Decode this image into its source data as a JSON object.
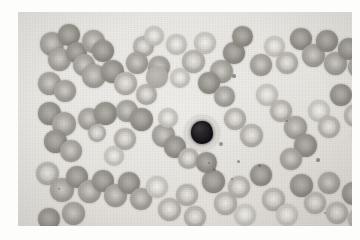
{
  "image": {
    "kind": "photomicrograph",
    "subject": "peripheral blood smear",
    "stain": "Wright-Giemsa",
    "border_color": "#ffffff",
    "field_color": "#e8e6e2",
    "plate": {
      "left": 18,
      "top": 12,
      "width": 334,
      "height": 214
    }
  },
  "palette": {
    "background": "#e8e6e2",
    "rbc_mid": "#a5a19b",
    "rbc_dark": "#8a867f",
    "rbc_pale": "#cbc8c2",
    "central_pallor": "#efedE8",
    "wbc_nucleus": "#171519",
    "wbc_cytoplasm": "#b9b6b1"
  },
  "cells": {
    "white_blood_cell": {
      "label": "lymphocyte",
      "x": 167,
      "y": 104,
      "size": 34,
      "nucleus_label": "dark round nucleus",
      "chromatin": [
        {
          "x": 34,
          "y": 26,
          "r": 4
        },
        {
          "x": 52,
          "y": 44,
          "r": 3
        },
        {
          "x": 28,
          "y": 52,
          "r": 3
        },
        {
          "x": 46,
          "y": 62,
          "r": 2
        }
      ]
    },
    "red_blood_cells": [
      {
        "x": 22,
        "y": 20,
        "d": 24,
        "t": "t1"
      },
      {
        "x": 40,
        "y": 12,
        "d": 22,
        "t": "t3"
      },
      {
        "x": 30,
        "y": 36,
        "d": 23,
        "t": "t1"
      },
      {
        "x": 48,
        "y": 30,
        "d": 21,
        "t": "t3"
      },
      {
        "x": 55,
        "y": 42,
        "d": 22,
        "t": "t1"
      },
      {
        "x": 64,
        "y": 18,
        "d": 23,
        "t": "t1"
      },
      {
        "x": 74,
        "y": 28,
        "d": 22,
        "t": "t3"
      },
      {
        "x": 64,
        "y": 52,
        "d": 24,
        "t": "t1"
      },
      {
        "x": 83,
        "y": 48,
        "d": 23,
        "t": "t3"
      },
      {
        "x": 20,
        "y": 60,
        "d": 23,
        "t": "t1"
      },
      {
        "x": 36,
        "y": 68,
        "d": 22,
        "t": "t1"
      },
      {
        "x": 96,
        "y": 60,
        "d": 23,
        "t": "t2"
      },
      {
        "x": 115,
        "y": 24,
        "d": 21,
        "t": "t2"
      },
      {
        "x": 108,
        "y": 40,
        "d": 22,
        "t": "t1"
      },
      {
        "x": 130,
        "y": 44,
        "d": 22,
        "t": "t1"
      },
      {
        "x": 126,
        "y": 14,
        "d": 20,
        "t": "t4"
      },
      {
        "x": 148,
        "y": 22,
        "d": 21,
        "t": "t4"
      },
      {
        "x": 164,
        "y": 38,
        "d": 23,
        "t": "t2"
      },
      {
        "x": 176,
        "y": 20,
        "d": 22,
        "t": "t4"
      },
      {
        "x": 192,
        "y": 48,
        "d": 23,
        "t": "t1"
      },
      {
        "x": 205,
        "y": 30,
        "d": 22,
        "t": "t3"
      },
      {
        "x": 214,
        "y": 14,
        "d": 21,
        "t": "t3"
      },
      {
        "x": 232,
        "y": 42,
        "d": 22,
        "t": "t1"
      },
      {
        "x": 246,
        "y": 24,
        "d": 21,
        "t": "t4"
      },
      {
        "x": 258,
        "y": 40,
        "d": 22,
        "t": "t2"
      },
      {
        "x": 272,
        "y": 16,
        "d": 22,
        "t": "t3"
      },
      {
        "x": 284,
        "y": 32,
        "d": 23,
        "t": "t1"
      },
      {
        "x": 298,
        "y": 18,
        "d": 22,
        "t": "t3"
      },
      {
        "x": 306,
        "y": 40,
        "d": 23,
        "t": "t1"
      },
      {
        "x": 320,
        "y": 26,
        "d": 22,
        "t": "t3"
      },
      {
        "x": 330,
        "y": 44,
        "d": 22,
        "t": "t1"
      },
      {
        "x": 336,
        "y": 14,
        "d": 20,
        "t": "t2"
      },
      {
        "x": 20,
        "y": 90,
        "d": 23,
        "t": "t3"
      },
      {
        "x": 34,
        "y": 100,
        "d": 24,
        "t": "t1"
      },
      {
        "x": 26,
        "y": 118,
        "d": 23,
        "t": "t3"
      },
      {
        "x": 42,
        "y": 128,
        "d": 22,
        "t": "t1"
      },
      {
        "x": 60,
        "y": 96,
        "d": 22,
        "t": "t1"
      },
      {
        "x": 76,
        "y": 90,
        "d": 23,
        "t": "t3"
      },
      {
        "x": 70,
        "y": 112,
        "d": 18,
        "t": "t2"
      },
      {
        "x": 98,
        "y": 88,
        "d": 22,
        "t": "t1"
      },
      {
        "x": 112,
        "y": 96,
        "d": 23,
        "t": "t3"
      },
      {
        "x": 118,
        "y": 72,
        "d": 21,
        "t": "t2"
      },
      {
        "x": 96,
        "y": 116,
        "d": 22,
        "t": "t2"
      },
      {
        "x": 134,
        "y": 112,
        "d": 23,
        "t": "t1"
      },
      {
        "x": 146,
        "y": 124,
        "d": 22,
        "t": "t3"
      },
      {
        "x": 140,
        "y": 96,
        "d": 20,
        "t": "t4"
      },
      {
        "x": 160,
        "y": 136,
        "d": 21,
        "t": "t2"
      },
      {
        "x": 180,
        "y": 60,
        "d": 22,
        "t": "t3"
      },
      {
        "x": 196,
        "y": 74,
        "d": 21,
        "t": "t1"
      },
      {
        "x": 206,
        "y": 96,
        "d": 22,
        "t": "t2"
      },
      {
        "x": 222,
        "y": 112,
        "d": 23,
        "t": "t2"
      },
      {
        "x": 238,
        "y": 72,
        "d": 22,
        "t": "t4"
      },
      {
        "x": 252,
        "y": 88,
        "d": 22,
        "t": "t2"
      },
      {
        "x": 266,
        "y": 104,
        "d": 23,
        "t": "t1"
      },
      {
        "x": 276,
        "y": 122,
        "d": 23,
        "t": "t3"
      },
      {
        "x": 262,
        "y": 136,
        "d": 22,
        "t": "t1"
      },
      {
        "x": 290,
        "y": 88,
        "d": 22,
        "t": "t4"
      },
      {
        "x": 300,
        "y": 104,
        "d": 22,
        "t": "t2"
      },
      {
        "x": 312,
        "y": 72,
        "d": 22,
        "t": "t3"
      },
      {
        "x": 326,
        "y": 92,
        "d": 23,
        "t": "t2"
      },
      {
        "x": 334,
        "y": 112,
        "d": 22,
        "t": "t4"
      },
      {
        "x": 18,
        "y": 150,
        "d": 23,
        "t": "t2"
      },
      {
        "x": 32,
        "y": 166,
        "d": 24,
        "t": "t1"
      },
      {
        "x": 48,
        "y": 154,
        "d": 22,
        "t": "t3"
      },
      {
        "x": 60,
        "y": 168,
        "d": 23,
        "t": "t1"
      },
      {
        "x": 74,
        "y": 158,
        "d": 22,
        "t": "t3"
      },
      {
        "x": 86,
        "y": 172,
        "d": 23,
        "t": "t1"
      },
      {
        "x": 100,
        "y": 160,
        "d": 22,
        "t": "t3"
      },
      {
        "x": 44,
        "y": 190,
        "d": 23,
        "t": "t1"
      },
      {
        "x": 20,
        "y": 196,
        "d": 22,
        "t": "t3"
      },
      {
        "x": 112,
        "y": 176,
        "d": 22,
        "t": "t1"
      },
      {
        "x": 128,
        "y": 164,
        "d": 22,
        "t": "t4"
      },
      {
        "x": 140,
        "y": 186,
        "d": 23,
        "t": "t2"
      },
      {
        "x": 158,
        "y": 172,
        "d": 22,
        "t": "t2"
      },
      {
        "x": 166,
        "y": 194,
        "d": 22,
        "t": "t2"
      },
      {
        "x": 184,
        "y": 158,
        "d": 23,
        "t": "t3"
      },
      {
        "x": 196,
        "y": 180,
        "d": 23,
        "t": "t2"
      },
      {
        "x": 210,
        "y": 164,
        "d": 22,
        "t": "t2"
      },
      {
        "x": 216,
        "y": 192,
        "d": 22,
        "t": "t4"
      },
      {
        "x": 232,
        "y": 152,
        "d": 22,
        "t": "t3"
      },
      {
        "x": 244,
        "y": 176,
        "d": 23,
        "t": "t2"
      },
      {
        "x": 258,
        "y": 192,
        "d": 22,
        "t": "t4"
      },
      {
        "x": 272,
        "y": 162,
        "d": 23,
        "t": "t3"
      },
      {
        "x": 286,
        "y": 180,
        "d": 22,
        "t": "t2"
      },
      {
        "x": 300,
        "y": 160,
        "d": 22,
        "t": "t1"
      },
      {
        "x": 308,
        "y": 190,
        "d": 22,
        "t": "t2"
      },
      {
        "x": 324,
        "y": 170,
        "d": 23,
        "t": "t3"
      },
      {
        "x": 330,
        "y": 196,
        "d": 22,
        "t": "t2"
      },
      {
        "x": 152,
        "y": 56,
        "d": 20,
        "t": "t4"
      },
      {
        "x": 86,
        "y": 134,
        "d": 20,
        "t": "t4"
      },
      {
        "x": 178,
        "y": 140,
        "d": 21,
        "t": "t3"
      }
    ],
    "crenated_cells": [
      {
        "x": 128,
        "y": 54,
        "d": 22
      }
    ],
    "platelets": [
      {
        "x": 214,
        "y": 62,
        "d": 4
      },
      {
        "x": 298,
        "y": 146,
        "d": 4
      }
    ],
    "specks": [
      {
        "x": 240,
        "y": 152,
        "d": 3
      },
      {
        "x": 268,
        "y": 108,
        "d": 2
      },
      {
        "x": 40,
        "y": 176,
        "d": 2
      },
      {
        "x": 190,
        "y": 150,
        "d": 2
      },
      {
        "x": 306,
        "y": 200,
        "d": 2
      }
    ]
  }
}
